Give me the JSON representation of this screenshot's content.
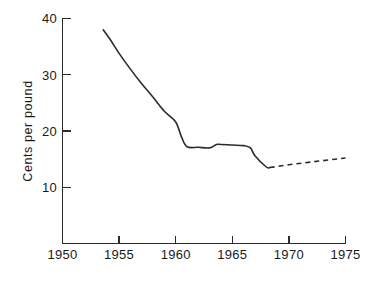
{
  "chart_data": {
    "type": "line",
    "title": "",
    "xlabel": "",
    "ylabel": "Cents per pound",
    "xlim": [
      1950,
      1975
    ],
    "ylim": [
      0,
      40
    ],
    "grid": false,
    "legend": "none",
    "xticks": [
      1950,
      1955,
      1960,
      1965,
      1970,
      1975
    ],
    "xtick_labels": [
      "1950",
      "1955",
      "1960",
      "1965",
      "1970",
      "1975"
    ],
    "yticks": [
      10,
      20,
      30,
      40
    ],
    "ytick_labels": [
      "10",
      "20",
      "30",
      "40"
    ],
    "series": [
      {
        "name": "observed",
        "style": "solid",
        "x": [
          1953.6,
          1954.2,
          1955.0,
          1956.0,
          1957.0,
          1958.0,
          1959.0,
          1960.0,
          1960.5,
          1961.0,
          1962.0,
          1963.0,
          1963.6,
          1964.0,
          1965.0,
          1966.0,
          1966.6,
          1967.0,
          1968.0,
          1968.3
        ],
        "y": [
          38.0,
          36.3,
          33.8,
          31.0,
          28.4,
          26.0,
          23.5,
          21.6,
          19.0,
          17.2,
          17.1,
          17.0,
          17.6,
          17.6,
          17.5,
          17.4,
          17.0,
          15.6,
          13.6,
          13.5
        ]
      },
      {
        "name": "projected",
        "style": "dashed",
        "x": [
          1968.3,
          1970.0,
          1972.0,
          1975.0
        ],
        "y": [
          13.5,
          14.0,
          14.5,
          15.2
        ]
      }
    ]
  },
  "axes": {
    "ylabel_text": "Cents per pound"
  }
}
